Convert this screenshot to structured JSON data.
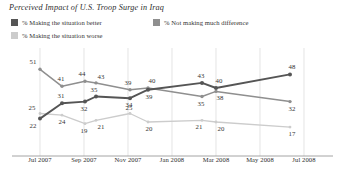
{
  "chart_title": "Perceived Impact of U.S. Troop Surge in Iraq",
  "legend": {
    "items": [
      {
        "label": "% Making the situation better",
        "color": "#555555",
        "icon": "legend-swatch-icon"
      },
      {
        "label": "% Not making much difference",
        "color": "#8f8f8f",
        "icon": "legend-swatch-icon"
      },
      {
        "label": "% Making the situation worse",
        "color": "#cccccc",
        "icon": "legend-swatch-icon"
      }
    ]
  },
  "axis": {
    "x_ticks": [
      "Jul 2007",
      "Sep 2007",
      "Nov 2007",
      "Jan 2008",
      "Mar 2008",
      "May 2008",
      "Jul 2008"
    ]
  },
  "chart_data": {
    "type": "line",
    "title": "Perceived Impact of U.S. Troop Surge in Iraq",
    "xlabel": "",
    "ylabel": "",
    "ylim": [
      0,
      60
    ],
    "grid": "vertical-only",
    "legend_position": "top",
    "x_tick_labels": [
      "Jul 2007",
      "Sep 2007",
      "Nov 2007",
      "Jan 2008",
      "Mar 2008",
      "May 2008",
      "Jul 2008"
    ],
    "x_positions_px": [
      40,
      62,
      85,
      96,
      130,
      148,
      202,
      216,
      290
    ],
    "series": [
      {
        "name": "% Making the situation better",
        "color": "#555555",
        "values": [
          22,
          31,
          32,
          35,
          34,
          39,
          43,
          40,
          48
        ],
        "labels": [
          "22",
          "31",
          "32",
          "35",
          "34",
          "39",
          "43",
          "40",
          "48"
        ]
      },
      {
        "name": "% Not making much difference",
        "color": "#8f8f8f",
        "values": [
          51,
          41,
          44,
          43,
          39,
          40,
          35,
          38,
          32
        ],
        "labels": [
          "51",
          "41",
          "44",
          "43",
          "39",
          "40",
          "35",
          "38",
          "32"
        ]
      },
      {
        "name": "% Making the situation worse",
        "color": "#cccccc",
        "values": [
          25,
          24,
          19,
          21,
          25,
          20,
          21,
          20,
          17
        ],
        "labels": [
          "25",
          "24",
          "19",
          "21",
          "25",
          "20",
          "21",
          "20",
          "17"
        ]
      }
    ]
  }
}
